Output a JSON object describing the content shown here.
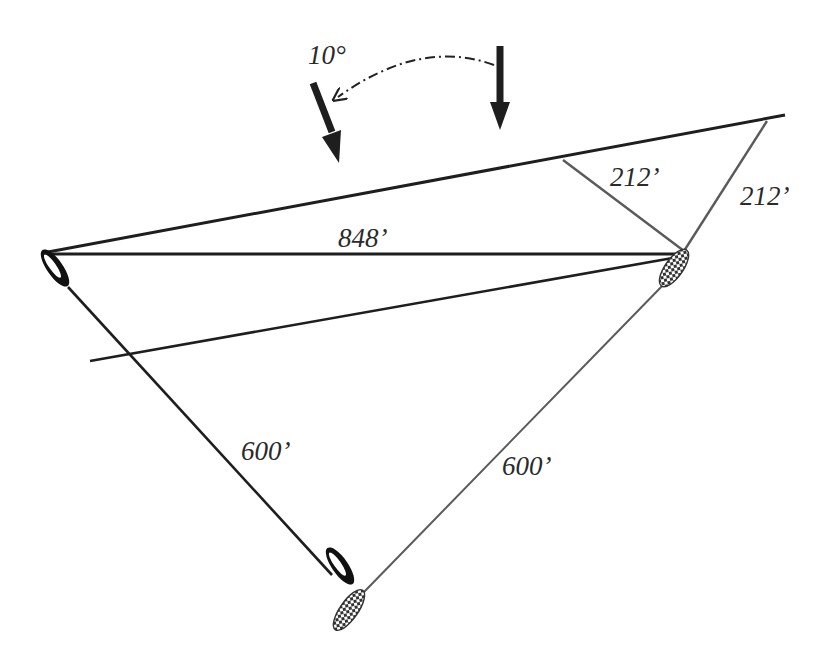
{
  "diagram": {
    "wind_shift": {
      "label": "10°",
      "old_wind_arrow": "down-arrow-icon",
      "new_wind_arrow": "down-left-arrow-icon",
      "shift_arc": "dash-dot-curved-arrow"
    },
    "labels": {
      "baseline_distance": "848’",
      "perpendicular_distance": "212’",
      "leg_distance": "212’",
      "left_boat_leg": "600’",
      "right_boat_leg": "600’"
    },
    "boats": [
      {
        "id": "solid-boat-top",
        "style": "solid-black"
      },
      {
        "id": "checkered-boat-top",
        "style": "checkered"
      },
      {
        "id": "solid-boat-bottom",
        "style": "solid-black"
      },
      {
        "id": "checkered-boat-bottom",
        "style": "checkered"
      }
    ],
    "colors": {
      "line_dark": "#1e1e1e",
      "line_gray": "#5a5a5a",
      "background": "#ffffff"
    }
  }
}
